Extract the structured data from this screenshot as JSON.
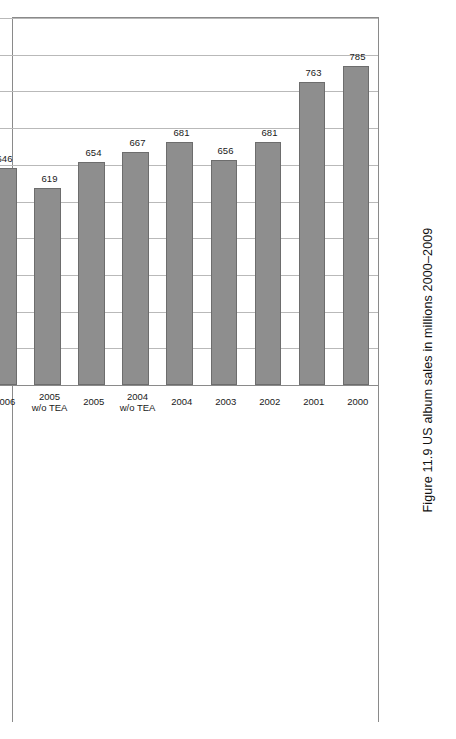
{
  "figure": {
    "caption": "Figure 11.9  US album sales in millions 2000–2009"
  },
  "chart_data": {
    "type": "bar",
    "orientation": "horizontal-rotated",
    "title": "US album sales in millions 2000–2009",
    "xlabel": "",
    "ylabel": "",
    "grid": true,
    "legend": false,
    "axis_ticks": [
      850,
      800,
      750,
      700,
      650,
      600,
      550,
      500,
      450,
      400,
      350
    ],
    "ylim": [
      350,
      850
    ],
    "baseline": 350,
    "categories": [
      "2000",
      "2001",
      "2002",
      "2003",
      "2004",
      "2004\nw/o TEA",
      "2005",
      "2005\nw/o TEA",
      "2006",
      "2006\nw/o TEA",
      "2007",
      "2007\nw/o TEA",
      "2008",
      "2008\nw/o TEA",
      "2009",
      "2009\nw/o TEA"
    ],
    "values": [
      785,
      763,
      681,
      656,
      681,
      667,
      654,
      619,
      646,
      588,
      584.9,
      500.5,
      535.4,
      428.4,
      489.8,
      373.9
    ],
    "value_labels": [
      "785",
      "763",
      "681",
      "656",
      "681",
      "667",
      "654",
      "619",
      "646",
      "588",
      "584.9",
      "500.5",
      "535.4",
      "428.4",
      "489.8",
      "373.9"
    ]
  },
  "colors": {
    "bar_fill": "#8e8e8e",
    "bar_stroke": "#6d6d6d",
    "gridline": "#b9b9b9",
    "axis": "#6f6f6f",
    "text": "#1a1a1a"
  }
}
